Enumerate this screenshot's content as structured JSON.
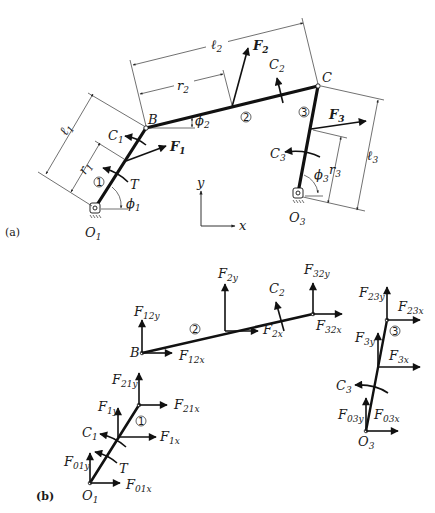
{
  "figure": {
    "part_a": {
      "tag": "(a)",
      "points": {
        "O1": "O",
        "O1_sub": "1",
        "B": "B",
        "C": "C",
        "O3": "O",
        "O3_sub": "3"
      },
      "links": {
        "link1": "1",
        "link2": "2",
        "link3": "3"
      },
      "dimensions": {
        "l1": "ℓ",
        "l1_sub": "1",
        "r1": "r",
        "r1_sub": "1",
        "l2": "ℓ",
        "l2_sub": "2",
        "r2": "r",
        "r2_sub": "2",
        "l3": "ℓ",
        "l3_sub": "3",
        "r3": "r",
        "r3_sub": "3"
      },
      "angles": {
        "phi1": "ϕ",
        "phi1_sub": "1",
        "phi2": "ϕ",
        "phi2_sub": "2",
        "phi3": "ϕ",
        "phi3_sub": "3"
      },
      "forces": {
        "F1": "F",
        "F1_sub": "1",
        "F2": "F",
        "F2_sub": "2",
        "F3": "F",
        "F3_sub": "3"
      },
      "moments": {
        "C1": "C",
        "C1_sub": "1",
        "C2": "C",
        "C2_sub": "2",
        "C3": "C",
        "C3_sub": "3",
        "T": "T"
      },
      "axes": {
        "x": "x",
        "y": "y"
      }
    },
    "part_b": {
      "tag": "(b)",
      "link2": {
        "B": "B",
        "F12y": "F",
        "F12y_sub": "12y",
        "F12x": "F",
        "F12x_sub": "12x",
        "F2y": "F",
        "F2y_sub": "2y",
        "F2x": "F",
        "F2x_sub": "2x",
        "C2": "C",
        "C2_sub": "2",
        "F32y": "F",
        "F32y_sub": "32y",
        "F32x": "F",
        "F32x_sub": "32x",
        "num": "2"
      },
      "link1": {
        "O1": "O",
        "O1_sub": "1",
        "F21y": "F",
        "F21y_sub": "21y",
        "F21x": "F",
        "F21x_sub": "21x",
        "F1y": "F",
        "F1y_sub": "1y",
        "F1x": "F",
        "F1x_sub": "1x",
        "C1": "C",
        "C1_sub": "1",
        "T": "T",
        "F01y": "F",
        "F01y_sub": "01y",
        "F01x": "F",
        "F01x_sub": "01x",
        "num": "1"
      },
      "link3": {
        "O3": "O",
        "O3_sub": "3",
        "F23y": "F",
        "F23y_sub": "23y",
        "F23x": "F",
        "F23x_sub": "23x",
        "F3y": "F",
        "F3y_sub": "3y",
        "F3x": "F",
        "F3x_sub": "3x",
        "C3": "C",
        "C3_sub": "3",
        "F03y": "F",
        "F03y_sub": "03y",
        "F03x": "F",
        "F03x_sub": "03x",
        "num": "3"
      }
    },
    "colors": {
      "ink": "#111111",
      "background": "#ffffff"
    }
  }
}
